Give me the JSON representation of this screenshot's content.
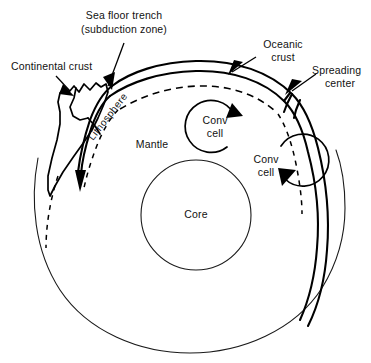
{
  "figure": {
    "background_color": "#ffffff",
    "line_color": "#000000"
  },
  "labels": {
    "continental_crust": "Continental crust",
    "sea_floor_trench_line1": "Sea floor trench",
    "sea_floor_trench_line2": "(subduction zone)",
    "oceanic_crust_line1": "Oceanic",
    "oceanic_crust_line2": "crust",
    "spreading_center_line1": "Spreading",
    "spreading_center_line2": "center",
    "lithosphere": "Lithosphere",
    "mantle": "Mantle",
    "core": "Core",
    "conv_cell_1_line1": "Conv",
    "conv_cell_1_line2": "cell",
    "conv_cell_2_line1": "Conv",
    "conv_cell_2_line2": "cell"
  },
  "geometry": {
    "earth_center_x": 190,
    "earth_center_y": 205,
    "earth_radius": 152,
    "core_center_x": 196,
    "core_center_y": 215,
    "core_radius": 55,
    "conv_cell_1_center_x": 215,
    "conv_cell_1_center_y": 126,
    "conv_cell_1_radius": 26,
    "conv_cell_2_center_x": 267,
    "conv_cell_2_center_y": 165,
    "conv_cell_2_radius": 26
  }
}
